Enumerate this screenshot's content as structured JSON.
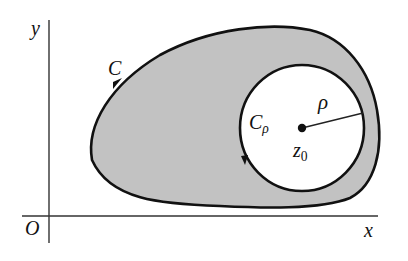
{
  "figure": {
    "type": "complex-analysis contour diagram",
    "colors": {
      "region_fill": "#c2c2c2",
      "curve": "#111111",
      "axis": "#333333",
      "background": "#ffffff"
    },
    "axes": {
      "x_label": "x",
      "y_label": "y",
      "origin_label": "O"
    },
    "outer_contour": {
      "label": "C",
      "orientation": "counterclockwise"
    },
    "inner_circle": {
      "label_main": "C",
      "label_sub": "ρ",
      "orientation": "clockwise",
      "center_label_main": "z",
      "center_label_sub": "0",
      "radius_label": "ρ"
    }
  }
}
